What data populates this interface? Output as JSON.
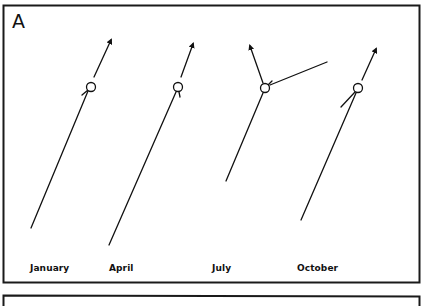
{
  "panel": {
    "label": "A",
    "border_color": "#1a1a1a"
  },
  "configurations": [
    {
      "month": "January",
      "label_x": 30,
      "node": {
        "cx": 91,
        "cy": 87,
        "r": 4.5
      },
      "trunk": {
        "x1": 31,
        "y1": 228,
        "x2": 88,
        "y2": 91
      },
      "stubs": [
        {
          "x1": 82,
          "y1": 95,
          "x2": 88,
          "y2": 90
        }
      ],
      "arrows": [
        {
          "x1": 94,
          "y1": 77,
          "x2": 111,
          "y2": 40
        }
      ],
      "branches": []
    },
    {
      "month": "April",
      "label_x": 110,
      "node": {
        "cx": 178,
        "cy": 87,
        "r": 4.5
      },
      "trunk": {
        "x1": 109,
        "y1": 245,
        "x2": 176,
        "y2": 92
      },
      "stubs": [
        {
          "x1": 179,
          "y1": 92,
          "x2": 180,
          "y2": 97
        }
      ],
      "arrows": [
        {
          "x1": 181,
          "y1": 77,
          "x2": 193,
          "y2": 44
        }
      ],
      "branches": []
    },
    {
      "month": "July",
      "label_x": 212,
      "node": {
        "cx": 265,
        "cy": 88,
        "r": 4.5
      },
      "trunk": {
        "x1": 226,
        "y1": 181,
        "x2": 263,
        "y2": 93
      },
      "stubs": [
        {
          "x1": 268,
          "y1": 85,
          "x2": 272,
          "y2": 81
        }
      ],
      "arrows": [
        {
          "x1": 263,
          "y1": 83,
          "x2": 250,
          "y2": 46
        }
      ],
      "branches": [
        {
          "x1": 270,
          "y1": 85,
          "x2": 327,
          "y2": 62
        }
      ]
    },
    {
      "month": "October",
      "label_x": 297,
      "node": {
        "cx": 358,
        "cy": 88,
        "r": 4.5
      },
      "trunk": {
        "x1": 301,
        "y1": 220,
        "x2": 356,
        "y2": 93
      },
      "stubs": [],
      "arrows": [
        {
          "x1": 362,
          "y1": 80,
          "x2": 376,
          "y2": 49
        }
      ],
      "branches": [
        {
          "x1": 355,
          "y1": 92,
          "x2": 341,
          "y2": 107
        }
      ]
    }
  ]
}
